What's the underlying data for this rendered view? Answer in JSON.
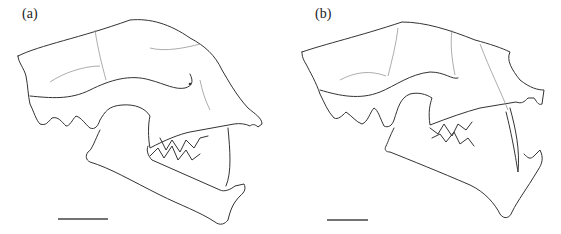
{
  "figure": {
    "panels": [
      {
        "id": "a",
        "label": "(a)",
        "subject": "skull-lateral-view-jaw-open",
        "scale_bar": {
          "x1": 58,
          "x2": 108,
          "y": 219
        }
      },
      {
        "id": "b",
        "label": "(b)",
        "subject": "skull-lateral-view-jaw-open-long-canines",
        "scale_bar": {
          "x1": 47,
          "x2": 88,
          "y": 220
        }
      }
    ],
    "colors": {
      "line": "#333333",
      "suture": "#888888",
      "background": "#ffffff"
    }
  }
}
